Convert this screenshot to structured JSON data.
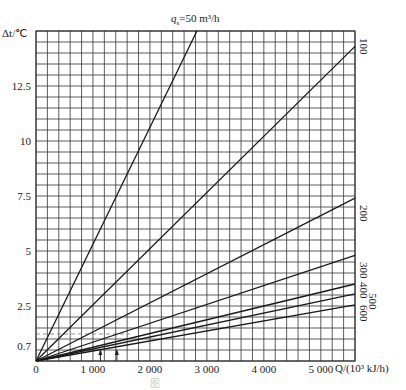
{
  "chart_data": {
    "type": "line",
    "xlabel": "Q/(10³ kJ/h)",
    "ylabel": "Δt/℃",
    "xlim": [
      0,
      5600
    ],
    "ylim": [
      0,
      15
    ],
    "grid": true,
    "x_ticks": [
      "0",
      "1 000",
      "2 000",
      "3 000",
      "4 000",
      "5 000"
    ],
    "x_tick_values": [
      0,
      1000,
      2000,
      3000,
      4000,
      5000
    ],
    "y_ticks": [
      "0.7",
      "2.5",
      "5",
      "7.5",
      "10",
      "12.5"
    ],
    "y_tick_values": [
      0.7,
      2.5,
      5,
      7.5,
      10,
      12.5
    ],
    "series": [
      {
        "name": "50",
        "x": [
          0,
          2825
        ],
        "y": [
          0,
          15
        ]
      },
      {
        "name": "100",
        "x": [
          0,
          5600
        ],
        "y": [
          0,
          14.3
        ]
      },
      {
        "name": "200",
        "x": [
          0,
          5600
        ],
        "y": [
          0,
          7.4
        ]
      },
      {
        "name": "300",
        "x": [
          0,
          5600
        ],
        "y": [
          0,
          4.8
        ]
      },
      {
        "name": "400",
        "x": [
          0,
          5600
        ],
        "y": [
          0,
          3.5
        ]
      },
      {
        "name": "500",
        "x": [
          0,
          5600
        ],
        "y": [
          0,
          3.05
        ]
      },
      {
        "name": "600",
        "x": [
          0,
          5600
        ],
        "y": [
          0,
          2.55
        ]
      }
    ],
    "annotations": [
      {
        "type": "arrow",
        "x": 1130,
        "direction": "up"
      },
      {
        "type": "arrow",
        "x": 1420,
        "direction": "up"
      },
      {
        "type": "dashed-line",
        "y": 1.2
      }
    ]
  },
  "labels": {
    "title_q": "q",
    "title_sub": "s",
    "title_rest": "=50 m³/h",
    "ylabel": "Δt/℃",
    "xlabel": "Q/(10³ kJ/h)",
    "series_labels": [
      "100",
      "200",
      "300",
      "400",
      "500",
      "600"
    ]
  }
}
